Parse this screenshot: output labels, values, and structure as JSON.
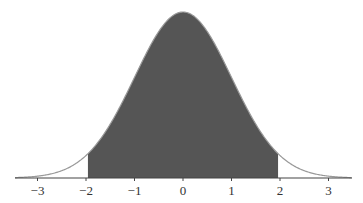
{
  "chart_data": {
    "type": "area",
    "title": "",
    "xlabel": "",
    "ylabel": "",
    "xlim": [
      -3.5,
      3.5
    ],
    "x_ticks": [
      -3,
      -2,
      -1,
      0,
      1,
      2,
      3
    ],
    "x_tick_labels": [
      "−3",
      "−2",
      "−1",
      "0",
      "1",
      "2",
      "3"
    ],
    "shaded_interval": [
      -1.96,
      1.96
    ],
    "distribution": {
      "name": "normal",
      "mean": 0,
      "sd": 1
    },
    "y_axis_visible": false,
    "grid": false
  },
  "colors": {
    "shade": "#555555",
    "curve": "#999999",
    "axis": "#444444"
  }
}
